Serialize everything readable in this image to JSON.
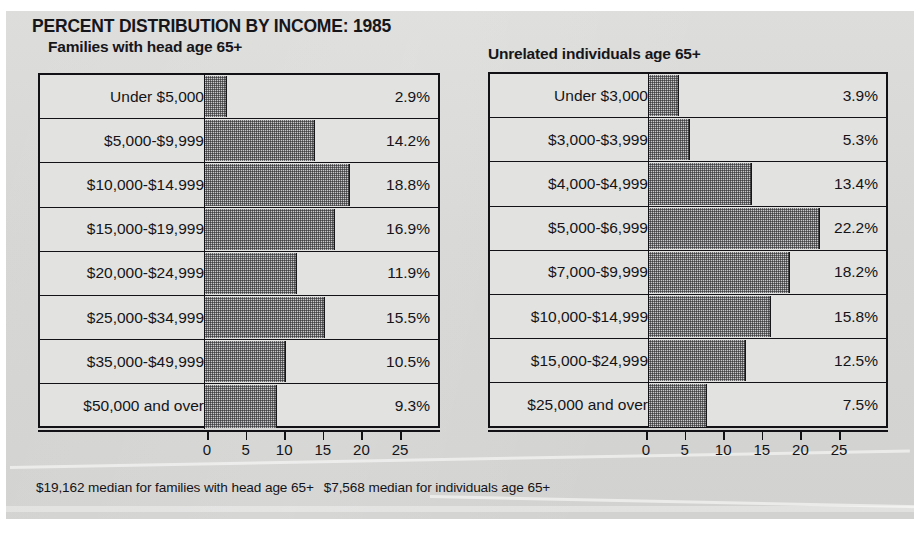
{
  "title": "PERCENT DISTRIBUTION BY INCOME: 1985",
  "panels": {
    "left": {
      "subtitle": "Families with head age 65+",
      "caption": "$19,162 median for families with head age 65+"
    },
    "right": {
      "subtitle": "Unrelated individuals age 65+",
      "caption": "$7,568 median for individuals age 65+"
    }
  },
  "axis": {
    "ticks": [
      "0",
      "5",
      "10",
      "15",
      "20",
      "25"
    ],
    "min": 0,
    "max": 25
  },
  "colors": {
    "paper": "#d8d8d6",
    "ink": "#121216",
    "bar_fill": "#c9c9c7",
    "row_fill": "#e2e2e0"
  },
  "chart_data": [
    {
      "type": "bar",
      "orientation": "horizontal",
      "title": "PERCENT DISTRIBUTION BY INCOME: 1985",
      "subtitle": "Families with head age 65+",
      "xlabel": "",
      "ylabel": "",
      "xlim": [
        0,
        25
      ],
      "grid": false,
      "legend": "none",
      "categories": [
        "Under $5,000",
        "$5,000-$9,999",
        "$10,000-$14.999",
        "$15,000-$19,999",
        "$20,000-$24,999",
        "$25,000-$34,999",
        "$35,000-$49,999",
        "$50,000 and over"
      ],
      "values": [
        2.9,
        14.2,
        18.8,
        16.9,
        11.9,
        15.5,
        10.5,
        9.3
      ],
      "data_labels": [
        "2.9%",
        "14.2%",
        "18.8%",
        "16.9%",
        "11.9%",
        "15.5%",
        "10.5%",
        "9.3%"
      ],
      "annotation": "$19,162 median for families with head age 65+"
    },
    {
      "type": "bar",
      "orientation": "horizontal",
      "title": "PERCENT DISTRIBUTION BY INCOME: 1985",
      "subtitle": "Unrelated individuals age 65+",
      "xlabel": "",
      "ylabel": "",
      "xlim": [
        0,
        25
      ],
      "grid": false,
      "legend": "none",
      "categories": [
        "Under $3,000",
        "$3,000-$3,999",
        "$4,000-$4,999",
        "$5,000-$6,999",
        "$7,000-$9,999",
        "$10,000-$14,999",
        "$15,000-$24,999",
        "$25,000 and over"
      ],
      "values": [
        3.9,
        5.3,
        13.4,
        22.2,
        18.2,
        15.8,
        12.5,
        7.5
      ],
      "data_labels": [
        "3.9%",
        "5.3%",
        "13.4%",
        "22.2%",
        "18.2%",
        "15.8%",
        "12.5%",
        "7.5%"
      ],
      "annotation": "$7,568 median for individuals age 65+"
    }
  ]
}
